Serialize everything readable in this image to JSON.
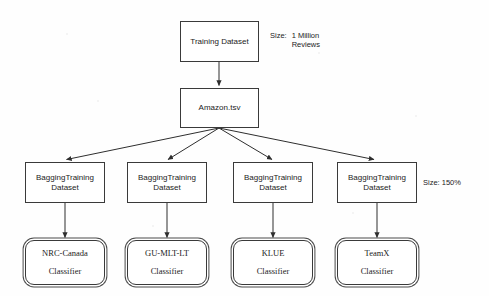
{
  "diagram": {
    "nodes": {
      "training_dataset": {
        "label": "Training Dataset"
      },
      "amazon_file": {
        "label": "Amazon.tsv"
      },
      "bagging": [
        {
          "line1": "BaggingTraining",
          "line2": "Dataset"
        },
        {
          "line1": "BaggingTraining",
          "line2": "Dataset"
        },
        {
          "line1": "BaggingTraining",
          "line2": "Dataset"
        },
        {
          "line1": "BaggingTraining",
          "line2": "Dataset"
        }
      ],
      "classifiers": [
        {
          "name": "NRC-Canada",
          "role": "Classifier"
        },
        {
          "name": "GU-MLT-LT",
          "role": "Classifier"
        },
        {
          "name": "KLUE",
          "role": "Classifier"
        },
        {
          "name": "TeamX",
          "role": "Classifier"
        }
      ]
    },
    "annotations": {
      "training_size_key": "Size:",
      "training_size_value_line1": "1 Million",
      "training_size_value_line2": "Reviews",
      "bagging_size": "Size: 150%"
    },
    "colors": {
      "stroke": "#3a3a3a",
      "text": "#1c1c1c",
      "background": "#fefefe"
    }
  }
}
